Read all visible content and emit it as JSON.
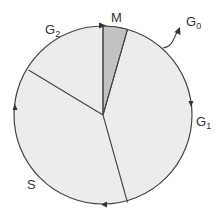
{
  "diagram": {
    "type": "cell-cycle-pie",
    "center": [
      103,
      115
    ],
    "radius": 89,
    "colors": {
      "fill": "#ececec",
      "m_fill": "#c2c2c2",
      "stroke": "#444444",
      "background": "#ffffff"
    },
    "phases": [
      {
        "id": "M",
        "label": "M",
        "sub": ""
      },
      {
        "id": "G1",
        "label": "G",
        "sub": "1"
      },
      {
        "id": "S",
        "label": "S",
        "sub": ""
      },
      {
        "id": "G2",
        "label": "G",
        "sub": "2"
      }
    ],
    "exit_label": {
      "label": "G",
      "sub": "0"
    },
    "direction": "clockwise"
  }
}
